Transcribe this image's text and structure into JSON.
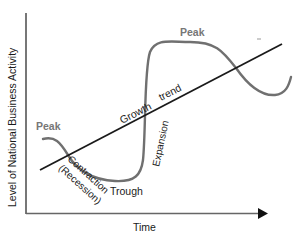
{
  "diagram": {
    "y_axis_label": "Level of National Business Activity",
    "x_axis_label": "Time",
    "labels": {
      "peak_left": "Peak",
      "peak_right": "Peak",
      "trough": "Trough",
      "growth": "Growth",
      "trend": "trend",
      "contraction": "Contraction",
      "recession": "(Recession)",
      "expansion": "Expansion"
    },
    "colors": {
      "axis": "#555555",
      "wave": "#707070",
      "trend_line": "#1a1a1a",
      "text": "#1a1a1a",
      "peak_text": "#777777"
    }
  }
}
